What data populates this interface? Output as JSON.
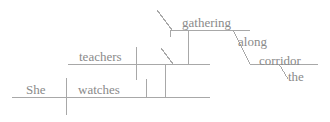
{
  "diagram": {
    "type": "reed-kellogg-sentence-diagram",
    "sentence": "She watches teachers gathering along the corridor",
    "line_color": "#a8a8a8",
    "text_color": "#8a8a8a",
    "words": [
      {
        "id": "subject",
        "text": "She",
        "x": 26,
        "y": 83,
        "role": "subject"
      },
      {
        "id": "verb",
        "text": "watches",
        "x": 78,
        "y": 83,
        "role": "verb"
      },
      {
        "id": "object",
        "text": "teachers",
        "x": 79,
        "y": 50,
        "role": "object"
      },
      {
        "id": "participle",
        "text": "gathering",
        "x": 182,
        "y": 16,
        "role": "participle"
      },
      {
        "id": "preposition",
        "text": "along",
        "x": 238,
        "y": 35,
        "role": "preposition"
      },
      {
        "id": "prep-object",
        "text": "corridor",
        "x": 259,
        "y": 54,
        "role": "object-of-preposition"
      },
      {
        "id": "article",
        "text": "the",
        "x": 288,
        "y": 70,
        "role": "article"
      }
    ],
    "lines": {
      "baseline": {
        "x1": 12,
        "y1": 97,
        "x2": 210,
        "y2": 97
      },
      "object_line": {
        "x1": 68,
        "y1": 64,
        "x2": 210,
        "y2": 64
      },
      "participle_line": {
        "x1": 170,
        "y1": 30,
        "x2": 250,
        "y2": 30
      },
      "prep_line": {
        "x1": 250,
        "y1": 64,
        "x2": 318,
        "y2": 64
      }
    }
  }
}
